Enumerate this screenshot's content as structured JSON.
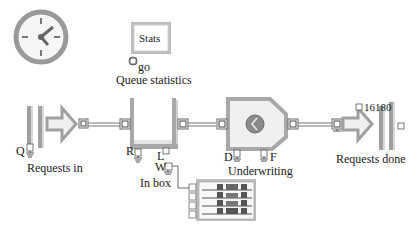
{
  "blocks": {
    "clock": {
      "icon": "clock-icon"
    },
    "stats": {
      "button_label": "Stats",
      "connector_label": "go",
      "title": "Queue statistics"
    },
    "requests_in": {
      "title": "Requests in",
      "connector_label": "Q"
    },
    "in_box": {
      "title": "In box",
      "connector_labels": [
        "R",
        "L",
        "W"
      ]
    },
    "underwriting": {
      "title": "Underwriting",
      "connector_labels": [
        "D",
        "F"
      ]
    },
    "requests_done": {
      "title": "Requests done",
      "count": "16180"
    },
    "plotter": {
      "icon": "plotter-icon",
      "rows": 4
    }
  },
  "colors": {
    "block_gray": "#a8a8a8",
    "block_fill": "#f4f4f4",
    "border_dark": "#6e6e6e",
    "connector_fill": "#ffffff",
    "plot_dark": "#555555"
  }
}
